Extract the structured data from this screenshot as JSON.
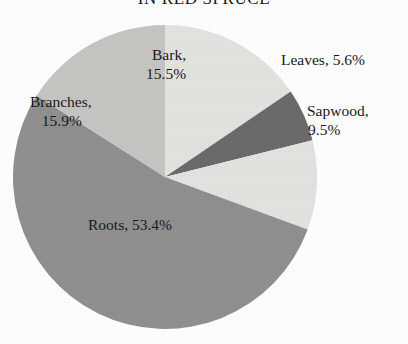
{
  "chart_data": {
    "type": "pie",
    "title": "IN RED SPRUCE",
    "title_note": "heading is cropped by the top edge of the scan",
    "xlabel": "",
    "ylabel": "",
    "legend": "none",
    "labels_inline": true,
    "unit": "%",
    "total": 99.9,
    "start_angle_deg": 0,
    "direction": "clockwise",
    "categories": [
      "Bark",
      "Leaves",
      "Sapwood",
      "Roots",
      "Branches"
    ],
    "values": [
      15.5,
      5.6,
      9.5,
      53.4,
      15.9
    ],
    "colors": [
      "#e3e3e1",
      "#6b6b6b",
      "#e3e3e1",
      "#909090",
      "#c5c5c3"
    ],
    "slices": [
      {
        "name": "Bark",
        "value": 15.5,
        "label": "Bark,",
        "value_label": "15.5%",
        "color": "#e3e3e1",
        "start_deg": 0.0,
        "end_deg": 55.8
      },
      {
        "name": "Leaves",
        "value": 5.6,
        "label": "Leaves,",
        "value_label": "5.6%",
        "color": "#6b6b6b",
        "start_deg": 55.8,
        "end_deg": 76.0
      },
      {
        "name": "Sapwood",
        "value": 9.5,
        "label": "Sapwood,",
        "value_label": "9.5%",
        "color": "#e3e3e1",
        "start_deg": 76.0,
        "end_deg": 110.2
      },
      {
        "name": "Roots",
        "value": 53.4,
        "label": "Roots,",
        "value_label": "53.4%",
        "color": "#909090",
        "start_deg": 110.2,
        "end_deg": 302.4
      },
      {
        "name": "Branches",
        "value": 15.9,
        "label": "Branches,",
        "value_label": "15.9%",
        "color": "#c5c5c3",
        "start_deg": 302.4,
        "end_deg": 360.0
      }
    ]
  },
  "labels": {
    "bark": {
      "name": "Bark,",
      "value": "15.5%"
    },
    "leaves": {
      "name": "Leaves, 5.6%"
    },
    "sapwood": {
      "name": "Sapwood,",
      "value": "9.5%"
    },
    "branches": {
      "name": "Branches,",
      "value": "15.9%"
    },
    "roots": {
      "name": "Roots, 53.4%"
    }
  },
  "page": {
    "background": "#ffffff",
    "text_color": "#19191c"
  }
}
